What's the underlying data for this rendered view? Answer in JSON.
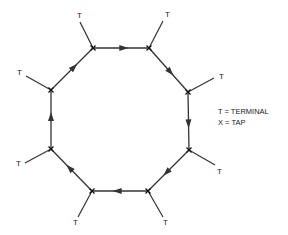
{
  "diagram": {
    "type": "ring-network",
    "direction": "clockwise",
    "colors": {
      "line": "#333333",
      "text": "#222222",
      "background": "#ffffff"
    },
    "nodes": [
      {
        "id": "tap-1",
        "kind": "tap",
        "x": 93,
        "y": 48,
        "terminal": {
          "label": "T",
          "x": 80,
          "y": 22,
          "lx": 77,
          "ly": 18
        }
      },
      {
        "id": "tap-2",
        "kind": "tap",
        "x": 149,
        "y": 48,
        "terminal": {
          "label": "T",
          "x": 163,
          "y": 21,
          "lx": 165,
          "ly": 17
        }
      },
      {
        "id": "tap-3",
        "kind": "tap",
        "x": 188,
        "y": 92,
        "terminal": {
          "label": "T",
          "x": 214,
          "y": 78,
          "lx": 219,
          "ly": 79
        }
      },
      {
        "id": "tap-4",
        "kind": "tap",
        "x": 189,
        "y": 150,
        "terminal": {
          "label": "T",
          "x": 215,
          "y": 165,
          "lx": 217,
          "ly": 174
        }
      },
      {
        "id": "tap-5",
        "kind": "tap",
        "x": 148,
        "y": 191,
        "terminal": {
          "label": "T",
          "x": 163,
          "y": 217,
          "lx": 163,
          "ly": 225
        }
      },
      {
        "id": "tap-6",
        "kind": "tap",
        "x": 92,
        "y": 191,
        "terminal": {
          "label": "T",
          "x": 78,
          "y": 217,
          "lx": 73,
          "ly": 225
        }
      },
      {
        "id": "tap-7",
        "kind": "tap",
        "x": 51,
        "y": 149,
        "terminal": {
          "label": "T",
          "x": 25,
          "y": 163,
          "lx": 16,
          "ly": 166
        }
      },
      {
        "id": "tap-8",
        "kind": "tap",
        "x": 51,
        "y": 90,
        "terminal": {
          "label": "T",
          "x": 26,
          "y": 76,
          "lx": 17,
          "ly": 75
        }
      }
    ],
    "edges": [
      {
        "from": "tap-1",
        "to": "tap-2"
      },
      {
        "from": "tap-2",
        "to": "tap-3"
      },
      {
        "from": "tap-3",
        "to": "tap-4"
      },
      {
        "from": "tap-4",
        "to": "tap-5"
      },
      {
        "from": "tap-5",
        "to": "tap-6"
      },
      {
        "from": "tap-6",
        "to": "tap-7"
      },
      {
        "from": "tap-7",
        "to": "tap-8"
      },
      {
        "from": "tap-8",
        "to": "tap-1"
      }
    ]
  },
  "legend": {
    "x": 218,
    "items": [
      {
        "text": "T = TERMINAL",
        "y": 114
      },
      {
        "text": "X = TAP",
        "y": 125
      }
    ]
  }
}
